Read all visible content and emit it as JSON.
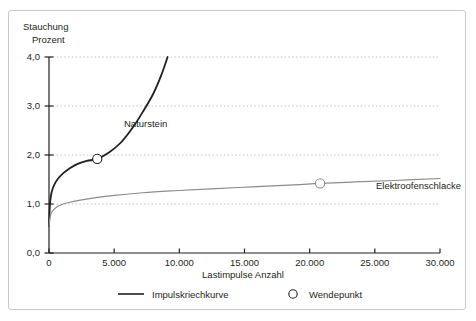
{
  "chart_data": {
    "type": "line",
    "title": "",
    "ylabel": "Stauchung\nProzent",
    "ylabel_line1": "Stauchung",
    "ylabel_line2": "Prozent",
    "xlabel": "Lastimpulse  Anzahl",
    "xlim": [
      0,
      30000
    ],
    "ylim": [
      0,
      4.0
    ],
    "grid": true,
    "grid_axis": "y",
    "legend_position": "bottom",
    "y_ticks": [
      0,
      1,
      2,
      3,
      4
    ],
    "y_tick_labels": [
      "0,0",
      "1,0",
      "2,0",
      "3,0",
      "4,0"
    ],
    "x_ticks": [
      0,
      5000,
      10000,
      15000,
      20000,
      25000,
      30000
    ],
    "x_tick_labels": [
      "0",
      "5.000",
      "10.000",
      "15.000",
      "20.000",
      "25.000",
      "30.000"
    ],
    "series": [
      {
        "name": "Naturstein",
        "color": "#231f20",
        "label_x": 7200,
        "label_y": 2.62,
        "x": [
          0,
          80,
          200,
          400,
          700,
          1100,
          1600,
          2200,
          2900,
          3700,
          4600,
          5500,
          6400,
          7200,
          8000,
          8600,
          9100
        ],
        "y": [
          0.55,
          1.02,
          1.24,
          1.39,
          1.52,
          1.63,
          1.73,
          1.82,
          1.88,
          1.92,
          2.05,
          2.25,
          2.55,
          2.88,
          3.25,
          3.62,
          4.0
        ]
      },
      {
        "name": "Elektroofenschlacke",
        "color": "#8c8c8c",
        "label_x": 24300,
        "label_y": 1.27,
        "x": [
          0,
          100,
          250,
          500,
          900,
          1500,
          2400,
          3600,
          5200,
          7200,
          9600,
          12400,
          15600,
          18800,
          20800,
          23500,
          26500,
          30000
        ],
        "y": [
          0.55,
          0.76,
          0.85,
          0.92,
          0.98,
          1.03,
          1.08,
          1.13,
          1.18,
          1.23,
          1.27,
          1.31,
          1.35,
          1.39,
          1.42,
          1.45,
          1.48,
          1.52
        ]
      }
    ],
    "markers": [
      {
        "name": "Wendepunkt Naturstein",
        "x": 3700,
        "y": 1.92,
        "color": "#231f20"
      },
      {
        "name": "Wendepunkt Elektroofenschlacke",
        "x": 20800,
        "y": 1.42,
        "color": "#8c8c8c"
      }
    ],
    "annotations": [
      {
        "name": "Naturstein",
        "text": "Naturstein"
      },
      {
        "name": "Elektroofenschlacke",
        "text": "Elektroofenschlacke"
      }
    ],
    "legend": [
      {
        "label": "Impulskriechkurve",
        "marker": "line",
        "color": "#231f20"
      },
      {
        "label": "Wendepunkt",
        "marker": "circle",
        "color": "#231f20"
      }
    ],
    "colors": {
      "axis": "#231f20",
      "grid": "#bfbfbf",
      "naturstein": "#231f20",
      "elektroofenschlacke": "#8c8c8c",
      "frame": "#c9c9c9",
      "background": "#ffffff"
    }
  }
}
